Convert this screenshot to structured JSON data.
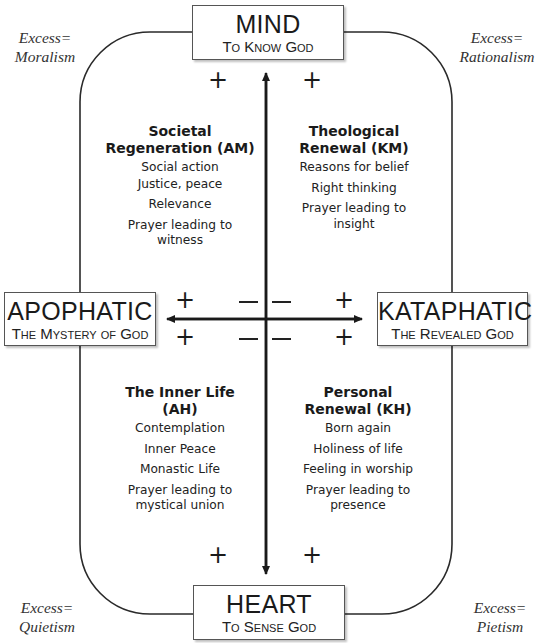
{
  "poles": {
    "top": {
      "title": "MIND",
      "subtitle": "To Know God"
    },
    "bottom": {
      "title": "HEART",
      "subtitle": "To Sense God"
    },
    "left": {
      "title": "APOPHATIC",
      "subtitle": "The Mystery of God"
    },
    "right": {
      "title": "KATAPHATIC",
      "subtitle": "The Revealed God"
    }
  },
  "excess": {
    "top_left": {
      "line1": "Excess=",
      "line2": "Moralism"
    },
    "top_right": {
      "line1": "Excess=",
      "line2": "Rationalism"
    },
    "bottom_left": {
      "line1": "Excess=",
      "line2": "Quietism"
    },
    "bottom_right": {
      "line1": "Excess=",
      "line2": "Pietism"
    }
  },
  "quadrants": {
    "top_left": {
      "title_line1": "Societal",
      "title_line2": "Regeneration (AM)",
      "items": [
        "Social action",
        "Justice, peace",
        "Relevance",
        "Prayer leading to",
        "witness"
      ]
    },
    "top_right": {
      "title_line1": "Theological",
      "title_line2": "Renewal (KM)",
      "items": [
        "Reasons for belief",
        "Right thinking",
        "Prayer leading to",
        "insight"
      ]
    },
    "bottom_left": {
      "title_line1": "The Inner Life",
      "title_line2": "(AH)",
      "items": [
        "Contemplation",
        "Inner Peace",
        "Monastic Life",
        "Prayer leading to",
        "mystical union"
      ]
    },
    "bottom_right": {
      "title_line1": "Personal",
      "title_line2": "Renewal (KH)",
      "items": [
        "Born again",
        "Holiness of life",
        "Feeling in worship",
        "Prayer leading to",
        "presence"
      ]
    }
  },
  "signs": {
    "plus": "+",
    "minus": "−"
  },
  "colors": {
    "line": "#1a1a1a",
    "text": "#1a1a1a",
    "box_border": "#555555"
  }
}
